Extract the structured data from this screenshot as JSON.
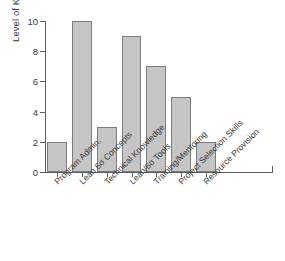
{
  "chart_data": {
    "type": "bar",
    "title": "",
    "subtitle": "",
    "xlabel": "",
    "ylabel": "Level of Knowledge",
    "categories": [
      "Program Admin.",
      "Lean 6σ Concepts",
      "Technical Knowledge",
      "Lean/6σ Tools",
      "Training/Mentoring",
      "Project Selection Skills",
      "Resource Provision"
    ],
    "values": [
      2,
      10,
      3,
      9,
      7,
      5,
      2
    ],
    "ylim": [
      0,
      10
    ],
    "ytick_labels": [
      "0",
      "2",
      "4",
      "6",
      "8",
      "10"
    ],
    "ytick_values": [
      0,
      2,
      4,
      6,
      8,
      10
    ],
    "grid": false,
    "legend": false,
    "legend_position": "none",
    "bar_fill_color": "#c5c5c5",
    "bar_border_color": "#7d7d7d",
    "axis_color": "#5d5d5d",
    "text_color": "#3a3a3a",
    "background_color": "#ffffff",
    "xtick_label_rotation": -45
  }
}
